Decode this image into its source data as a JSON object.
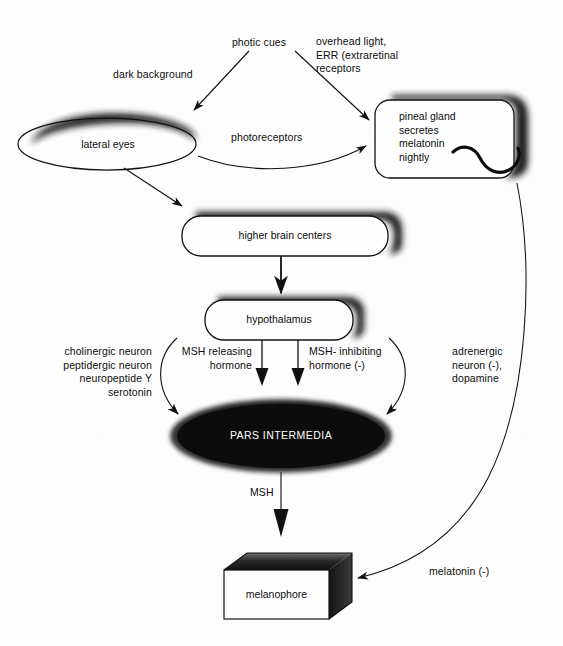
{
  "diagram": {
    "background_color": "#fdfdfd",
    "ink_color": "#0d0d0d",
    "shadow_color": "#1a1a1a",
    "nodes": [
      {
        "id": "lateral-eyes",
        "label": "lateral eyes",
        "shape": "ellipse-shadowed",
        "x": 18,
        "y": 118,
        "w": 178,
        "h": 52
      },
      {
        "id": "pineal-gland",
        "label": "pineal gland\nsecretes\nmelatonin\nnightly",
        "shape": "rounded-rect-shadowed",
        "x": 375,
        "y": 90,
        "w": 146,
        "h": 85
      },
      {
        "id": "higher-brain-centers",
        "label": "higher brain centers",
        "shape": "rounded-rect-shadowed",
        "x": 182,
        "y": 208,
        "w": 216,
        "h": 44
      },
      {
        "id": "hypothalamus",
        "label": "hypothalamus",
        "shape": "rounded-rect-shadowed",
        "x": 205,
        "y": 293,
        "w": 154,
        "h": 43
      },
      {
        "id": "pars-intermedia",
        "label": "PARS INTERMEDIA",
        "shape": "ellipse-filled",
        "x": 170,
        "y": 400,
        "w": 220,
        "h": 72
      },
      {
        "id": "melanophore",
        "label": "melanophore",
        "shape": "box-3d",
        "x": 224,
        "y": 556,
        "w": 128,
        "h": 62
      }
    ],
    "edge_labels": [
      {
        "id": "photic-cues",
        "text": "photic cues",
        "align": "center",
        "x": 211,
        "y": 36,
        "w": 96
      },
      {
        "id": "overhead-light",
        "text": "overhead light,\nERR (extraretinal\nreceptors",
        "align": "left",
        "x": 316,
        "y": 35,
        "w": 128
      },
      {
        "id": "dark-background",
        "text": "dark background",
        "align": "left",
        "x": 113,
        "y": 68,
        "w": 110
      },
      {
        "id": "photoreceptors",
        "text": "photoreceptors",
        "align": "left",
        "x": 231,
        "y": 131,
        "w": 96
      },
      {
        "id": "left-neurons",
        "text": "cholinergic neuron\npeptidergic neuron\nneuropeptide Y\nserotonin",
        "align": "right",
        "x": 24,
        "y": 345,
        "w": 128
      },
      {
        "id": "msh-releasing",
        "text": "MSH releasing\nhormone",
        "align": "right",
        "x": 160,
        "y": 345,
        "w": 92
      },
      {
        "id": "msh-inhibiting",
        "text": "MSH- inhibiting\nhormone (-)",
        "align": "left",
        "x": 309,
        "y": 345,
        "w": 100
      },
      {
        "id": "adrenergic",
        "text": "adrenergic\nneuron (-),\ndopamine",
        "align": "left",
        "x": 452,
        "y": 345,
        "w": 92
      },
      {
        "id": "msh",
        "text": "MSH",
        "align": "left",
        "x": 250,
        "y": 486,
        "w": 40
      },
      {
        "id": "melatonin-neg",
        "text": "melatonin (-)",
        "align": "left",
        "x": 429,
        "y": 565,
        "w": 84
      }
    ],
    "connections": [
      {
        "id": "photic-to-eyes",
        "from": "photic cues",
        "to": "lateral eyes",
        "style": "straight-arrow"
      },
      {
        "id": "photic-to-pineal",
        "from": "photic cues",
        "to": "pineal gland",
        "style": "straight-arrow"
      },
      {
        "id": "eyes-to-pineal",
        "from": "lateral eyes",
        "to": "pineal gland",
        "style": "curved-arrow"
      },
      {
        "id": "eyes-to-brain",
        "from": "lateral eyes",
        "to": "higher brain centers",
        "style": "straight-arrow"
      },
      {
        "id": "brain-to-hypothalamus",
        "from": "higher brain centers",
        "to": "hypothalamus",
        "style": "straight-arrow"
      },
      {
        "id": "hypothalamus-msh-release",
        "from": "hypothalamus",
        "to": "pars intermedia",
        "style": "thick-arrow"
      },
      {
        "id": "hypothalamus-msh-inhibit",
        "from": "hypothalamus",
        "to": "pars intermedia",
        "style": "thick-arrow"
      },
      {
        "id": "left-neurons-to-pars",
        "from": "neurons",
        "to": "pars intermedia",
        "style": "curved-arrow"
      },
      {
        "id": "adrenergic-to-pars",
        "from": "adrenergic",
        "to": "pars intermedia",
        "style": "curved-arrow"
      },
      {
        "id": "pars-to-melanophore",
        "from": "pars intermedia",
        "to": "melanophore",
        "style": "thick-arrow"
      },
      {
        "id": "pineal-to-melanophore",
        "from": "pineal gland",
        "to": "melanophore",
        "style": "long-curve-arrow"
      }
    ]
  }
}
